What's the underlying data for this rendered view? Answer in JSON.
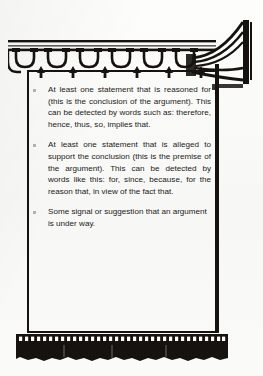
{
  "page": {
    "background_color": "#fbfbfa",
    "ink_color": "#1b1917",
    "ornament_color": "#15120f",
    "bullet_color": "#b4b2ae"
  },
  "ornaments": {
    "top_band": {
      "icon": "scalloped-arch-band-ornament",
      "arch_count": 6,
      "description": "horizontal band of scalloped arches with arrow finial drops"
    },
    "corner_flourish": {
      "icon": "horn-flourish-ornament",
      "description": "flared trumpet/horn shaped decorative flourish at top right"
    },
    "bottom_fringe": {
      "icon": "tassel-fringe-ornament",
      "description": "row of white dots over a solid black tasseled fringe band"
    }
  },
  "content": {
    "bullets": [
      {
        "marker": "square-bullet",
        "align": "justify",
        "text": "At least one statement that is reasoned for (this is the conclusion of the argument). This can be detected by words such as: therefore, hence, thus, so, implies that."
      },
      {
        "marker": "square-bullet",
        "align": "justify",
        "text": "At least one statement that is alleged to support the conclusion (this is the premise of the argument). This can be detected by words like this: for, since, because, for the reason that, in view of the fact that."
      },
      {
        "marker": "square-bullet",
        "align": "left",
        "text": "Some signal or suggestion that an argument is under way."
      }
    ]
  }
}
